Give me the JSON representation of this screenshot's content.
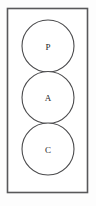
{
  "figure": {
    "kind": "venn-style-stacked-circles",
    "background_color": "#fdfdfd",
    "frame": {
      "name": "outer-rectangle",
      "x": 7.5,
      "y": 8.5,
      "width": 80,
      "height": 184,
      "stroke_color": "#58585a",
      "fill_color": "#ffffff"
    },
    "circle_style": {
      "radius": 26,
      "center_x": 48,
      "stroke_color": "#4a4a4c",
      "fill_color": "#ffffff"
    },
    "nodes": [
      {
        "label": "P",
        "center_y": 46
      },
      {
        "label": "A",
        "center_y": 97.5
      },
      {
        "label": "C",
        "center_y": 149
      }
    ]
  }
}
